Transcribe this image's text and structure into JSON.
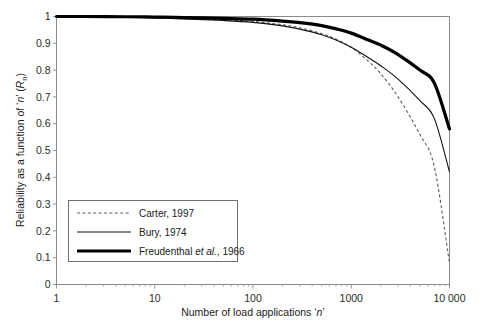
{
  "chart_data": {
    "type": "line",
    "title": "",
    "xlabel": "Number of load applications ‘n’",
    "ylabel": "Reliability as a function of ‘n’ (R",
    "ylabel_sub": "n",
    "ylabel_tail": ")",
    "xscale": "log",
    "yscale": "linear",
    "xlim": [
      1,
      10000
    ],
    "ylim": [
      0,
      1
    ],
    "grid": false,
    "legend_position": "lower-left-inside",
    "x_tick_labels": [
      "1",
      "10",
      "100",
      "1000",
      "10 000"
    ],
    "x_tick_values": [
      1,
      10,
      100,
      1000,
      10000
    ],
    "y_tick_labels": [
      "0",
      "0.1",
      "0.2",
      "0.3",
      "0.4",
      "0.5",
      "0.6",
      "0.7",
      "0.8",
      "0.9",
      "1"
    ],
    "y_tick_values": [
      0,
      0.1,
      0.2,
      0.3,
      0.4,
      0.5,
      0.6,
      0.7,
      0.8,
      0.9,
      1
    ],
    "x": [
      1,
      2,
      5,
      10,
      20,
      50,
      100,
      200,
      300,
      500,
      700,
      1000,
      1500,
      2000,
      3000,
      5000,
      7000,
      10000
    ],
    "series": [
      {
        "name": "Carter, 1997",
        "style": "dashed",
        "color": "#5c5c5c",
        "values": [
          1.0,
          0.999,
          0.998,
          0.996,
          0.993,
          0.988,
          0.982,
          0.969,
          0.958,
          0.936,
          0.915,
          0.885,
          0.832,
          0.786,
          0.7,
          0.56,
          0.44,
          0.08
        ]
      },
      {
        "name": "Bury, 1974",
        "style": "solid-thin",
        "color": "#111111",
        "values": [
          1.0,
          0.999,
          0.997,
          0.995,
          0.991,
          0.985,
          0.978,
          0.965,
          0.953,
          0.932,
          0.912,
          0.885,
          0.846,
          0.816,
          0.766,
          0.686,
          0.62,
          0.42
        ]
      },
      {
        "name": "Freudenthal et al., 1966",
        "name_plain": "Freudenthal ",
        "name_italic": "et al.",
        "name_tail": ", 1966",
        "style": "solid-thick",
        "color": "#000000",
        "values": [
          1.0,
          1.0,
          0.999,
          0.998,
          0.996,
          0.993,
          0.99,
          0.983,
          0.977,
          0.966,
          0.954,
          0.938,
          0.912,
          0.893,
          0.858,
          0.8,
          0.752,
          0.58
        ]
      }
    ]
  },
  "legend": {
    "items": [
      {
        "label": "Carter, 1997",
        "swatch": "dashed-line-swatch"
      },
      {
        "label": "Bury, 1974",
        "swatch": "thin-line-swatch"
      },
      {
        "label_plain": "Freudenthal ",
        "label_italic": "et al.",
        "label_tail": ", 1966",
        "swatch": "thick-line-swatch"
      }
    ]
  },
  "axes": {
    "x_title": "Number of load applications ‘n’",
    "x_title_plain_a": "Number of load applications ‘",
    "x_title_italic": "n",
    "x_title_plain_b": "’",
    "y_title_plain_a": "Reliability as a function of ‘",
    "y_title_italic": "n",
    "y_title_plain_b": "’ (",
    "y_title_italic2": "R",
    "y_title_sub": "n",
    "y_title_plain_c": ")"
  },
  "colors": {
    "background": "#ffffff",
    "frame": "#8a8a8a",
    "text": "#1a1a1a",
    "carter": "#5c5c5c",
    "bury": "#111111",
    "freudenthal": "#000000"
  }
}
